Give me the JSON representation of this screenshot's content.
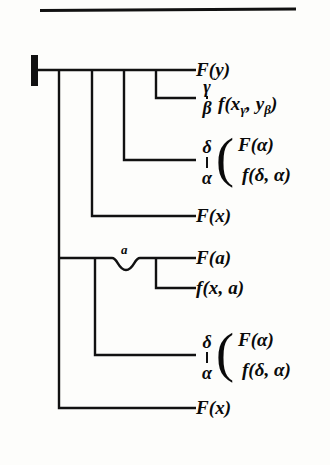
{
  "figure": {
    "top_rule": "horizontal-rule",
    "root_marker": "thick-vertical-bar",
    "arc_label": "ɑ"
  },
  "leaves": [
    {
      "id": "leaf-1",
      "text": "F(y)"
    },
    {
      "id": "leaf-2",
      "qualifier_top": "γ",
      "qualifier_bottom": "β",
      "text": "f(x",
      "sub1": "γ",
      "text2": ", y",
      "sub2": "β",
      "text3": ")"
    },
    {
      "id": "leaf-3",
      "qualifier_top": "δ",
      "qualifier_bottom": "α",
      "group_line_1": "F(α)",
      "group_line_2": "f(δ, α)"
    },
    {
      "id": "leaf-4",
      "text": "F(x)"
    },
    {
      "id": "leaf-5",
      "text": "F(ɑ)"
    },
    {
      "id": "leaf-6",
      "text": "f(x, ɑ)"
    },
    {
      "id": "leaf-7",
      "qualifier_top": "δ",
      "qualifier_bottom": "α",
      "group_line_1": "F(α)",
      "group_line_2": "f(δ, α)"
    },
    {
      "id": "leaf-8",
      "text": "F(x)"
    }
  ],
  "labels": {
    "l1": "F(y)",
    "l2_a": "f(x",
    "l2_sub1": "γ",
    "l2_b": ", y",
    "l2_sub2": "β",
    "l2_c": ")",
    "l2_gtop": "γ",
    "l2_gbot": "β",
    "l3_gtop": "δ",
    "l3_gbot": "α",
    "l3_line1": "F(α)",
    "l3_line2": "f(δ, α)",
    "l4": "F(x)",
    "l5": "F(ɑ)",
    "l6": "f(x, ɑ)",
    "l7_gtop": "δ",
    "l7_gbot": "α",
    "l7_line1": "F(α)",
    "l7_line2": "f(δ, α)",
    "l8": "F(x)",
    "arc": "ɑ"
  },
  "colors": {
    "ink": "#111111",
    "paper": "#fdfdfb"
  }
}
